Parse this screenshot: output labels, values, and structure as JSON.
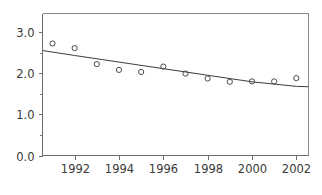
{
  "chart_data": {
    "type": "scatter",
    "title": "",
    "subtitle": "",
    "xlabel": "",
    "ylabel": "",
    "x": [
      1991,
      1992,
      1993,
      1994,
      1995,
      1996,
      1997,
      1998,
      1999,
      2000,
      2001,
      2002
    ],
    "values": [
      2.72,
      2.61,
      2.22,
      2.08,
      2.03,
      2.16,
      1.99,
      1.87,
      1.79,
      1.8,
      1.8,
      1.88
    ],
    "series": [
      {
        "name": "observations",
        "type": "scatter",
        "marker": "open-circle",
        "values": [
          2.72,
          2.61,
          2.22,
          2.08,
          2.03,
          2.16,
          1.99,
          1.87,
          1.79,
          1.8,
          1.8,
          1.88
        ]
      },
      {
        "name": "trend",
        "type": "line",
        "x": [
          1990.55,
          1992,
          1994,
          1996,
          1998,
          2000,
          2002,
          2002.55
        ],
        "values": [
          2.55,
          2.43,
          2.27,
          2.11,
          1.95,
          1.79,
          1.68,
          1.67
        ]
      }
    ],
    "xlim": [
      1990.55,
      2002.55
    ],
    "ylim": [
      0.0,
      3.45
    ],
    "yticks": [
      0.0,
      1.0,
      2.0,
      3.0
    ],
    "ytick_labels": [
      "0.0",
      "1.0",
      "2.0",
      "3.0"
    ],
    "yticks_minor": [
      0.5,
      1.5,
      2.5,
      3.5
    ],
    "xticks": [
      1992,
      1994,
      1996,
      1998,
      2000,
      2002
    ],
    "xtick_labels": [
      "1992",
      "1994",
      "1996",
      "1998",
      "2000",
      "2002"
    ],
    "grid": false,
    "legend": null,
    "colors": {
      "background": "#ffffff",
      "marker_stroke": "#4a4a4a",
      "trend_line": "#3c3c3c",
      "axis": "#6e6e6e",
      "frame": "#8a8a8a",
      "tick_text": "#3a3a3a"
    }
  }
}
